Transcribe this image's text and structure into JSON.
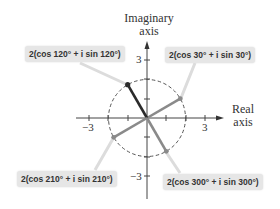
{
  "diagram": {
    "axes": {
      "y_title_line1": "Imaginary",
      "y_title_line2": "axis",
      "x_title_line1": "Real",
      "x_title_line2": "axis",
      "tick_labels": {
        "x_neg": "−3",
        "x_pos": "3",
        "y_pos": "3",
        "y_neg": "−3"
      }
    },
    "circle": {
      "radius": 2,
      "style": "dashed"
    },
    "points": [
      {
        "label": "2(cos 30° + i sin 30°)",
        "angle_deg": 30,
        "modulus": 2,
        "color": "#8a8a8a"
      },
      {
        "label": "2(cos 120° + i sin 120°)",
        "angle_deg": 120,
        "modulus": 2,
        "color": "#2b2b2b"
      },
      {
        "label": "2(cos 210° + i sin 210°)",
        "angle_deg": 210,
        "modulus": 2,
        "color": "#8a8a8a"
      },
      {
        "label": "2(cos 300° + i sin 300°)",
        "angle_deg": 300,
        "modulus": 2,
        "color": "#8a8a8a"
      }
    ]
  }
}
